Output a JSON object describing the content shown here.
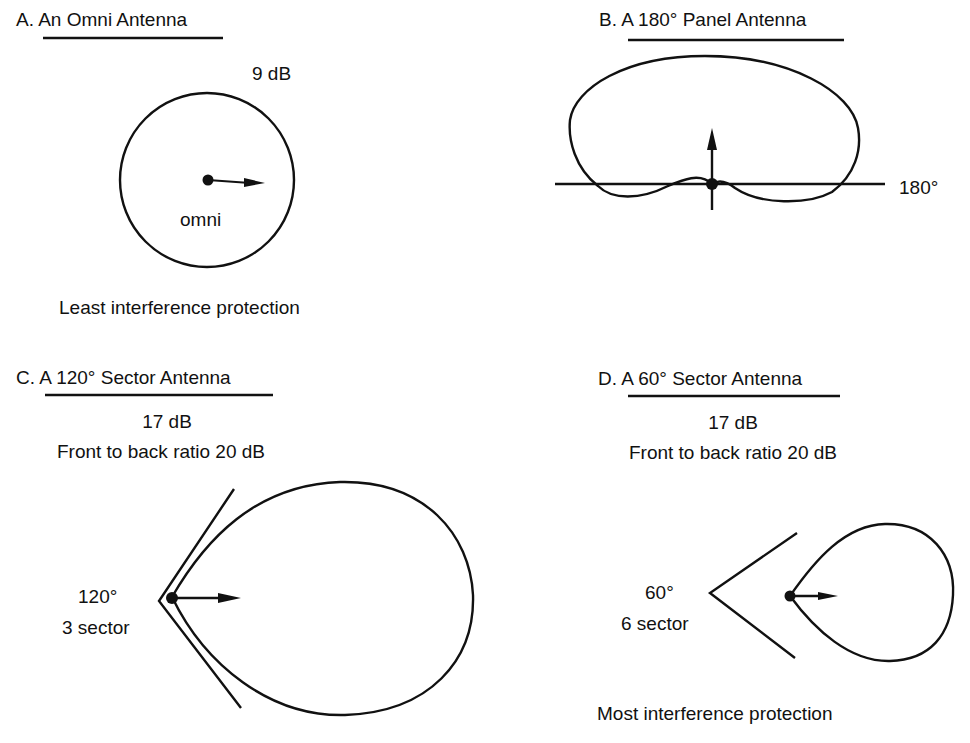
{
  "panels": {
    "a": {
      "prefix": "A.",
      "title": "An Omni Antenna",
      "gain": "9 dB",
      "pattern_label": "omni",
      "caption": "Least interference protection"
    },
    "b": {
      "prefix": "B.",
      "title": "A 180° Panel Antenna",
      "beam_label": "180°"
    },
    "c": {
      "prefix": "C.",
      "title": "A 120° Sector Antenna",
      "gain": "17 dB",
      "ratio": "Front to back ratio 20 dB",
      "angle": "120°",
      "sectors": "3 sector"
    },
    "d": {
      "prefix": "D.",
      "title": "A 60° Sector Antenna",
      "gain": "17 dB",
      "ratio": "Front to back ratio 20 dB",
      "angle": "60°",
      "sectors": "6 sector",
      "caption": "Most interference protection"
    }
  },
  "colors": {
    "ink": "#111111",
    "background": "#ffffff"
  }
}
